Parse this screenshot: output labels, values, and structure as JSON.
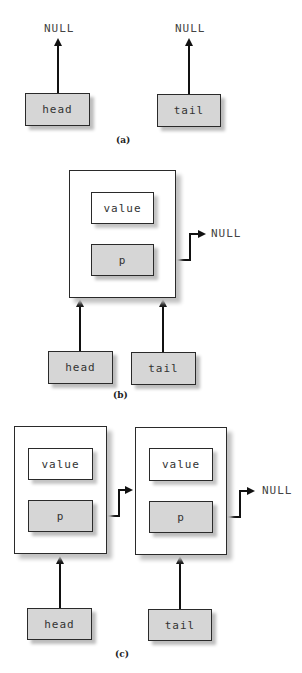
{
  "figure": {
    "panels": [
      {
        "caption": "(a)",
        "pointers": [
          {
            "label": "head",
            "target": "NULL"
          },
          {
            "label": "tail",
            "target": "NULL"
          }
        ],
        "null_labels": [
          "NULL",
          "NULL"
        ]
      },
      {
        "caption": "(b)",
        "nodes": [
          {
            "value_label": "value",
            "pointer_label": "p",
            "next": "NULL"
          }
        ],
        "pointers": [
          {
            "label": "head",
            "target": "node 1"
          },
          {
            "label": "tail",
            "target": "node 1"
          }
        ],
        "null_label": "NULL"
      },
      {
        "caption": "(c)",
        "nodes": [
          {
            "value_label": "value",
            "pointer_label": "p",
            "next": "node 2"
          },
          {
            "value_label": "value",
            "pointer_label": "p",
            "next": "NULL"
          }
        ],
        "pointers": [
          {
            "label": "head",
            "target": "node 1"
          },
          {
            "label": "tail",
            "target": "node 2"
          }
        ],
        "null_label": "NULL"
      }
    ]
  },
  "colors": {
    "pointer_box_fill": "#d6d6d6",
    "node_fill": "#ffffff",
    "line": "#111111"
  }
}
